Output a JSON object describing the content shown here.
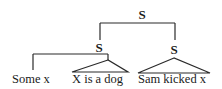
{
  "diagram": {
    "type": "syntax-tree",
    "root": {
      "label": "S",
      "children": [
        {
          "label": "S",
          "children": [
            {
              "label": "Some x",
              "leaf": true
            },
            {
              "label": "X is a dog",
              "leaf": true,
              "triangle": true
            }
          ]
        },
        {
          "label": "S",
          "children": [
            {
              "label": "Sam kicked x",
              "leaf": true,
              "triangle": true
            }
          ]
        }
      ]
    },
    "nodes": {
      "root": "S",
      "left_s": "S",
      "right_s": "S",
      "leaf_some_x": "Some x",
      "leaf_x_is_a_dog": "X is a dog",
      "leaf_sam_kicked_x": "Sam kicked x"
    },
    "line_color": "#2a2a2a"
  }
}
